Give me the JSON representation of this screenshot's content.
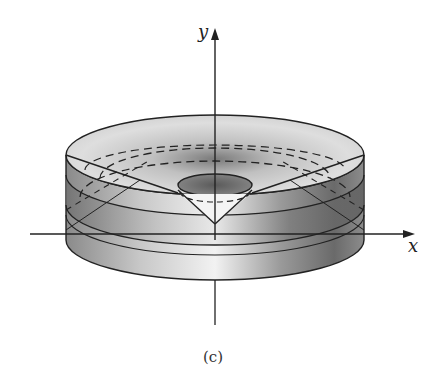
{
  "figure": {
    "caption": "(c)",
    "axes": {
      "x_label": "x",
      "y_label": "y"
    },
    "colors": {
      "line": "#222222",
      "shade_dark": "#5a5a5a",
      "shade_light": "#eeeeee",
      "background": "#ffffff"
    }
  }
}
